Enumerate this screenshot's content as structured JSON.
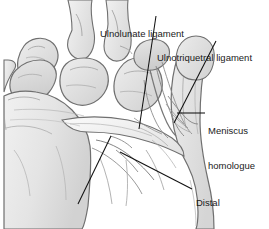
{
  "figure": {
    "width": 269,
    "height": 229,
    "background_color": "#ffffff",
    "line_color": "#6e6e6e",
    "bone_fill_light": "#e8e8e8",
    "bone_fill_mid": "#d6d6d6",
    "bone_fill_dark": "#c4c4c4",
    "leader_color": "#111111",
    "text_color": "#1a1a1a"
  },
  "labels": [
    {
      "id": "ulnolunate-ligament",
      "text": "Ulnolunate ligament",
      "lines": [
        "Ulnolunate ligament"
      ],
      "leader": {
        "x1": 156,
        "y1": 16,
        "x2": 139,
        "y2": 129
      }
    },
    {
      "id": "ulnotriquetral-ligament",
      "text": "Ulnotriquetral ligament",
      "lines": [
        "Ulnotriquetral ligament"
      ],
      "leader": {
        "x1": 216,
        "y1": 41,
        "x2": 174,
        "y2": 123
      }
    },
    {
      "id": "meniscus-homologue",
      "text": "Meniscus homologue",
      "lines": [
        "Meniscus",
        "homologue"
      ],
      "leader": {
        "x1": 205,
        "y1": 113,
        "x2": 177,
        "y2": 113
      }
    },
    {
      "id": "distal-radioulnar-ligament",
      "text": "Distal radioulnar ligament",
      "lines": [
        "Distal",
        "radioulnar",
        "ligament"
      ],
      "leader": {
        "x1": 192,
        "y1": 189,
        "x2": 120,
        "y2": 152
      }
    },
    {
      "id": "central-disc",
      "text": "Central disc",
      "lines": [
        "Central disc"
      ],
      "leader": {
        "x1": 78,
        "y1": 204,
        "x2": 111,
        "y2": 136
      }
    }
  ],
  "structures": [
    {
      "id": "scaphoid",
      "name": "scaphoid-bone"
    },
    {
      "id": "lunate",
      "name": "lunate-bone"
    },
    {
      "id": "triquetrum",
      "name": "triquetrum-bone"
    },
    {
      "id": "capitate",
      "name": "capitate-bone"
    },
    {
      "id": "hamate",
      "name": "hamate-bone"
    },
    {
      "id": "radius",
      "name": "radius-bone"
    },
    {
      "id": "ulna",
      "name": "ulna-bone"
    },
    {
      "id": "tfcc",
      "name": "triangular-fibrocartilage-complex"
    }
  ]
}
